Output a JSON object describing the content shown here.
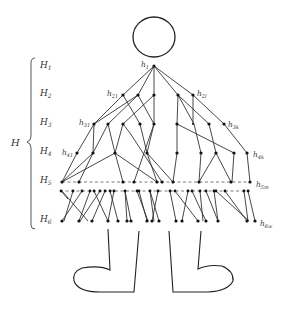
{
  "diagram": {
    "title": "",
    "bracket_label": "H",
    "levels": [
      {
        "label": "H",
        "sub": "1",
        "y": 66
      },
      {
        "label": "H",
        "sub": "2",
        "y": 94
      },
      {
        "label": "H",
        "sub": "3",
        "y": 122
      },
      {
        "label": "H",
        "sub": "4",
        "y": 152
      },
      {
        "label": "H",
        "sub": "5",
        "y": 181
      },
      {
        "label": "H",
        "sub": "6",
        "y": 219
      }
    ],
    "node_labels": [
      {
        "text": "h",
        "sub": "1",
        "x": 141,
        "y": 68
      },
      {
        "text": "h",
        "sub": "21",
        "x": 107,
        "y": 96
      },
      {
        "text": "h",
        "sub": "2l",
        "x": 196,
        "y": 96
      },
      {
        "text": "h",
        "sub": "31",
        "x": 78,
        "y": 124
      },
      {
        "text": "h",
        "sub": "3k",
        "x": 228,
        "y": 126
      },
      {
        "text": "h",
        "sub": "41",
        "x": 63,
        "y": 155
      },
      {
        "text": "h",
        "sub": "4k",
        "x": 253,
        "y": 157
      },
      {
        "text": "h",
        "sub": "5m",
        "x": 256,
        "y": 187
      },
      {
        "text": "h",
        "sub": "6w",
        "x": 260,
        "y": 226
      }
    ],
    "figure": {
      "head": {
        "cx": 154,
        "cy": 37,
        "rx": 21,
        "ry": 20
      },
      "legs": "two boot-shaped feet below the tree"
    }
  }
}
